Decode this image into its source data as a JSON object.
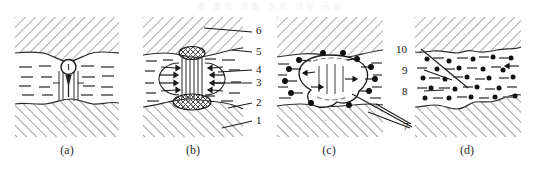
{
  "figure": {
    "top_faint_text": "图  放电  通道  发展  过程  示意",
    "panels": [
      {
        "id": "a",
        "caption": "(a)",
        "upper_polarity": "−",
        "lower_polarity": "+",
        "description": "initial contact bubble with downward arrow"
      },
      {
        "id": "b",
        "caption": "(b)",
        "upper_polarity": "−",
        "lower_polarity": "+",
        "description": "bridge column with crater blobs and converging arrows"
      },
      {
        "id": "c",
        "caption": "(c)",
        "upper_polarity": "−",
        "lower_polarity": "+",
        "description": "expanded cavity with particles ejecting outward"
      },
      {
        "id": "d",
        "caption": "(d)",
        "upper_polarity": "−",
        "lower_polarity": "+",
        "description": "collapsed gap with dispersed debris particles"
      }
    ],
    "callouts": [
      {
        "number": "1",
        "panel": "b"
      },
      {
        "number": "2",
        "panel": "b"
      },
      {
        "number": "3",
        "panel": "b"
      },
      {
        "number": "4",
        "panel": "b"
      },
      {
        "number": "5",
        "panel": "b"
      },
      {
        "number": "6",
        "panel": "b"
      },
      {
        "number": "7",
        "panel": "cd"
      },
      {
        "number": "8",
        "panel": "cd"
      },
      {
        "number": "9",
        "panel": "cd"
      },
      {
        "number": "10",
        "panel": "cd"
      }
    ]
  }
}
